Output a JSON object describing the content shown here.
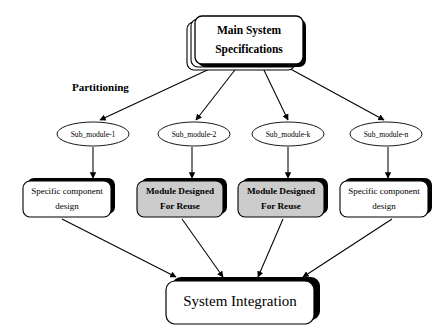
{
  "diagram": {
    "type": "flow-diagram",
    "canvas": {
      "width": 445,
      "height": 333,
      "background": "#ffffff"
    },
    "colors": {
      "stroke": "#000000",
      "white_fill": "#ffffff",
      "gray_fill": "#cccccc",
      "shadow": "#000000",
      "text": "#000000"
    },
    "annotations": [
      {
        "id": "partitioning-label",
        "text": "Partitioning",
        "x": 72,
        "y": 88
      }
    ],
    "top_node": {
      "id": "main-system-specifications",
      "shape": "stacked-rounded-rectangle",
      "line1": "Main System",
      "line2": "Specifications",
      "x": 195,
      "y": 16,
      "width": 108,
      "height": 48,
      "stack_layers": 3,
      "fill": "#ffffff",
      "bold": true
    },
    "ellipses": [
      {
        "id": "sub-module-1",
        "label": "Sub_module-1",
        "cx": 93,
        "cy": 134,
        "rx": 36,
        "ry": 12
      },
      {
        "id": "sub-module-2",
        "label": "Sub_module-2",
        "cx": 194,
        "cy": 134,
        "rx": 36,
        "ry": 12
      },
      {
        "id": "sub-module-k",
        "label": "Sub_module-k",
        "cx": 288,
        "cy": 134,
        "rx": 36,
        "ry": 12
      },
      {
        "id": "sub-module-n",
        "label": "Sub_module-n",
        "cx": 386,
        "cy": 134,
        "rx": 36,
        "ry": 12
      }
    ],
    "module_boxes": [
      {
        "id": "specific-component-design-1",
        "kind": "plain",
        "line1": "Specific component",
        "line2": "design",
        "x": 23,
        "y": 181,
        "width": 88,
        "height": 36,
        "fill": "#ffffff",
        "bold": false
      },
      {
        "id": "module-designed-for-reuse-1",
        "kind": "reuse",
        "line1": "Module Designed",
        "line2": "For Reuse",
        "x": 137,
        "y": 181,
        "width": 86,
        "height": 36,
        "fill": "#cccccc",
        "bold": true
      },
      {
        "id": "module-designed-for-reuse-2",
        "kind": "reuse",
        "line1": "Module Designed",
        "line2": "For Reuse",
        "x": 238,
        "y": 181,
        "width": 86,
        "height": 36,
        "fill": "#cccccc",
        "bold": true
      },
      {
        "id": "specific-component-design-2",
        "kind": "plain",
        "line1": "Specific component",
        "line2": "design",
        "x": 340,
        "y": 181,
        "width": 88,
        "height": 36,
        "fill": "#ffffff",
        "bold": false
      }
    ],
    "bottom_node": {
      "id": "system-integration",
      "label": "System Integration",
      "x": 166,
      "y": 280,
      "width": 148,
      "height": 43,
      "fill": "#ffffff",
      "bold": false
    },
    "edges": [
      {
        "id": "edge-spec-to-sub1",
        "from": "main-system-specifications",
        "to": "sub-module-1",
        "x1": 216,
        "y1": 66,
        "x2": 100,
        "y2": 120
      },
      {
        "id": "edge-spec-to-sub2",
        "from": "main-system-specifications",
        "to": "sub-module-2",
        "x1": 238,
        "y1": 66,
        "x2": 196,
        "y2": 120
      },
      {
        "id": "edge-spec-to-subk",
        "from": "main-system-specifications",
        "to": "sub-module-k",
        "x1": 262,
        "y1": 66,
        "x2": 288,
        "y2": 120
      },
      {
        "id": "edge-spec-to-subn",
        "from": "main-system-specifications",
        "to": "sub-module-n",
        "x1": 285,
        "y1": 66,
        "x2": 384,
        "y2": 120
      },
      {
        "id": "edge-sub1-to-box1",
        "from": "sub-module-1",
        "to": "specific-component-design-1",
        "x1": 93,
        "y1": 147,
        "x2": 93,
        "y2": 178
      },
      {
        "id": "edge-sub2-to-box2",
        "from": "sub-module-2",
        "to": "module-designed-for-reuse-1",
        "x1": 192,
        "y1": 147,
        "x2": 192,
        "y2": 178
      },
      {
        "id": "edge-subk-to-box3",
        "from": "sub-module-k",
        "to": "module-designed-for-reuse-2",
        "x1": 288,
        "y1": 147,
        "x2": 288,
        "y2": 178
      },
      {
        "id": "edge-subn-to-box4",
        "from": "sub-module-n",
        "to": "specific-component-design-2",
        "x1": 388,
        "y1": 147,
        "x2": 388,
        "y2": 178
      },
      {
        "id": "edge-box1-to-integration",
        "from": "specific-component-design-1",
        "to": "system-integration",
        "x1": 62,
        "y1": 219,
        "x2": 176,
        "y2": 277
      },
      {
        "id": "edge-box2-to-integration",
        "from": "module-designed-for-reuse-1",
        "to": "system-integration",
        "x1": 182,
        "y1": 219,
        "x2": 223,
        "y2": 277
      },
      {
        "id": "edge-box3-to-integration",
        "from": "module-designed-for-reuse-2",
        "to": "system-integration",
        "x1": 283,
        "y1": 219,
        "x2": 258,
        "y2": 277
      },
      {
        "id": "edge-box4-to-integration",
        "from": "specific-component-design-2",
        "to": "system-integration",
        "x1": 392,
        "y1": 219,
        "x2": 303,
        "y2": 277
      }
    ]
  }
}
